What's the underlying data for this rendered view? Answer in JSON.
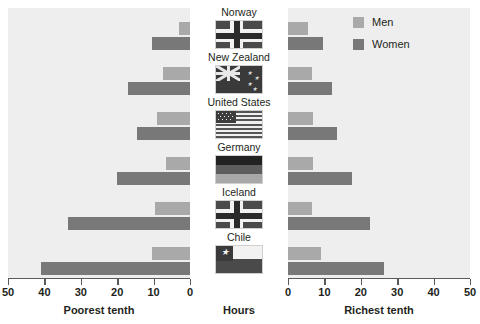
{
  "chart_data": {
    "type": "bar",
    "title": "",
    "subtitle": "",
    "orientation": "horizontal",
    "layout": "diverging-pyramid",
    "xlabel": "Hours",
    "ylabel": "",
    "grid": false,
    "legend_position": "top-right",
    "categories": [
      "Norway",
      "New Zealand",
      "United States",
      "Germany",
      "Iceland",
      "Chile"
    ],
    "panels": [
      {
        "name": "left",
        "label": "Poorest tenth",
        "direction": "right-to-left",
        "xlim": [
          0,
          50
        ],
        "ticks": [
          50,
          40,
          30,
          20,
          10,
          0
        ],
        "series": [
          {
            "name": "Men",
            "values": [
              3.0,
              7.5,
              9.0,
              6.5,
              9.5,
              10.5
            ]
          },
          {
            "name": "Women",
            "values": [
              10.5,
              17.0,
              14.5,
              20.0,
              33.5,
              41.0
            ]
          }
        ]
      },
      {
        "name": "right",
        "label": "Richest tenth",
        "direction": "left-to-right",
        "xlim": [
          0,
          50
        ],
        "ticks": [
          0,
          10,
          20,
          30,
          40,
          50
        ],
        "series": [
          {
            "name": "Men",
            "values": [
              5.5,
              6.5,
              7.0,
              7.0,
              6.5,
              9.0
            ]
          },
          {
            "name": "Women",
            "values": [
              9.5,
              12.0,
              13.5,
              17.5,
              22.5,
              26.5
            ]
          }
        ]
      }
    ],
    "colors": {
      "men": "#a9a9a9",
      "women": "#787878",
      "panel_background": "#eeeeee",
      "page_background": "#ffffff",
      "axis": "#58595b",
      "text": "#231f20"
    }
  },
  "legend": {
    "items": [
      {
        "label": "Men",
        "color": "#a9a9a9",
        "swatch_name": "legend-swatch-men"
      },
      {
        "label": "Women",
        "color": "#787878",
        "swatch_name": "legend-swatch-women"
      }
    ]
  },
  "axis_left": {
    "caption": "Poorest tenth",
    "tick_labels": [
      "50",
      "40",
      "30",
      "20",
      "10",
      "0"
    ]
  },
  "axis_right": {
    "caption": "Richest tenth",
    "tick_labels": [
      "0",
      "10",
      "20",
      "30",
      "40",
      "50"
    ]
  },
  "axis_center": {
    "caption": "Hours"
  },
  "center_column": {
    "rows": [
      {
        "country": "Norway",
        "flag_name": "flag-norway"
      },
      {
        "country": "New Zealand",
        "flag_name": "flag-new-zealand"
      },
      {
        "country": "United States",
        "flag_name": "flag-united-states"
      },
      {
        "country": "Germany",
        "flag_name": "flag-germany"
      },
      {
        "country": "Iceland",
        "flag_name": "flag-iceland"
      },
      {
        "country": "Chile",
        "flag_name": "flag-chile"
      }
    ]
  }
}
